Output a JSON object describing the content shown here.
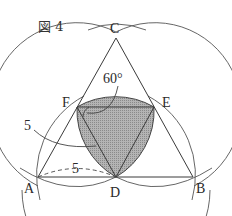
{
  "figure": {
    "title": "図 4",
    "points": {
      "A": "A",
      "B": "B",
      "C": "C",
      "D": "D",
      "E": "E",
      "F": "F"
    },
    "annotations": {
      "angle": "60°",
      "radius_label": "5",
      "segment_label": "5"
    },
    "colors": {
      "stroke": "#444444",
      "shade": "#9a9a9a",
      "background": "#ffffff"
    }
  }
}
